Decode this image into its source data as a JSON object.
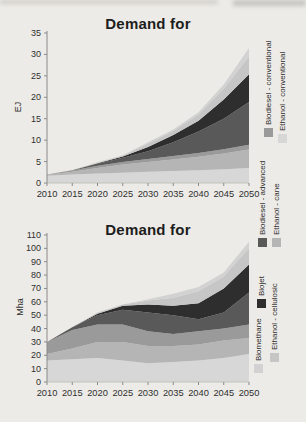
{
  "page": {
    "background": "#edebe7"
  },
  "chart_data": [
    {
      "type": "area",
      "stacked": true,
      "title": "Demand for",
      "ylabel": "EJ",
      "xlabel": "",
      "ylim": [
        0,
        35
      ],
      "ystep": 5,
      "grid": false,
      "legend_position": "right-rotated",
      "x": [
        2010,
        2015,
        2020,
        2025,
        2030,
        2035,
        2040,
        2045,
        2050
      ],
      "series": [
        {
          "name": "Ethanol - conventional",
          "color": "#d7d7d7",
          "values": [
            1.7,
            2.0,
            2.2,
            2.4,
            2.6,
            2.8,
            3.0,
            3.2,
            3.5
          ]
        },
        {
          "name": "Ethanol - cane",
          "color": "#b5b5b5",
          "values": [
            0.2,
            0.6,
            1.3,
            1.9,
            2.3,
            2.7,
            3.1,
            3.7,
            4.3
          ]
        },
        {
          "name": "Biodiesel - conventional",
          "color": "#9a9a9a",
          "values": [
            0.1,
            0.3,
            0.5,
            0.6,
            0.7,
            0.8,
            0.9,
            1.0,
            1.1
          ]
        },
        {
          "name": "Biodiesel - advanced",
          "color": "#595959",
          "values": [
            0.0,
            0.1,
            0.5,
            1.0,
            1.8,
            3.2,
            5.0,
            7.1,
            10.0
          ]
        },
        {
          "name": "Biojet",
          "color": "#2e2e2e",
          "values": [
            0.0,
            0.0,
            0.1,
            0.3,
            1.0,
            1.7,
            2.5,
            4.5,
            6.5
          ]
        },
        {
          "name": "Ethanol - cellulosic",
          "color": "#c6c6c6",
          "values": [
            0.0,
            0.0,
            0.1,
            0.2,
            0.8,
            1.0,
            1.5,
            2.5,
            4.1
          ]
        },
        {
          "name": "Biomethane",
          "color": "#d2d2d2",
          "values": [
            0.0,
            0.0,
            0.2,
            0.1,
            0.3,
            0.3,
            0.5,
            1.0,
            2.0
          ]
        }
      ]
    },
    {
      "type": "area",
      "stacked": true,
      "title": "Demand for",
      "ylabel": "Mha",
      "xlabel": "",
      "ylim": [
        0,
        110
      ],
      "ystep": 10,
      "grid": false,
      "legend_position": "right-rotated",
      "x": [
        2010,
        2015,
        2020,
        2025,
        2030,
        2035,
        2040,
        2045,
        2050
      ],
      "series": [
        {
          "name": "Ethanol - conventional",
          "color": "#d7d7d7",
          "values": [
            16,
            17,
            18,
            16,
            14,
            15,
            16,
            18,
            21
          ]
        },
        {
          "name": "Ethanol - cane",
          "color": "#b5b5b5",
          "values": [
            5,
            8,
            12,
            14,
            13,
            12,
            12,
            13,
            12
          ]
        },
        {
          "name": "Biodiesel - conventional",
          "color": "#9a9a9a",
          "values": [
            9,
            14,
            13,
            13,
            11,
            9,
            10,
            9,
            10
          ]
        },
        {
          "name": "Biodiesel - advanced",
          "color": "#595959",
          "values": [
            0,
            2,
            7,
            11,
            14,
            14,
            9,
            12,
            24
          ]
        },
        {
          "name": "Biojet",
          "color": "#2e2e2e",
          "values": [
            0,
            0,
            1,
            3,
            6,
            7,
            12,
            18,
            21
          ]
        },
        {
          "name": "Ethanol - cellulosic",
          "color": "#c6c6c6",
          "values": [
            0,
            0,
            1,
            1,
            3,
            6,
            9,
            9,
            12
          ]
        },
        {
          "name": "Biomethane",
          "color": "#d2d2d2",
          "values": [
            0,
            0,
            0,
            0,
            1,
            3,
            3,
            3,
            5
          ]
        }
      ]
    }
  ],
  "legend": {
    "items": [
      {
        "label": "Biodiesel - conventional",
        "color": "#9a9a9a"
      },
      {
        "label": "Ethanol - conventional",
        "color": "#d7d7d7"
      },
      {
        "label": "Biodiesel - advanced",
        "color": "#595959"
      },
      {
        "label": "Ethanol - cane",
        "color": "#b5b5b5"
      },
      {
        "label": "Biojet",
        "color": "#2e2e2e"
      },
      {
        "label": "Ethanol - cellulosic",
        "color": "#c6c6c6"
      },
      {
        "label": "Biomethane",
        "color": "#d2d2d2"
      }
    ]
  }
}
